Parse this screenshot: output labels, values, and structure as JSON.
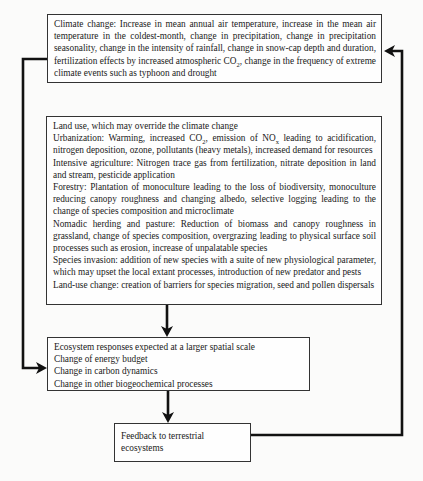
{
  "diagram": {
    "boxes": {
      "climate_change": {
        "text_parts": {
          "a": "Climate change: Increase in mean annual air temperature, increase in the mean air temperature in the coldest-month, change in precipitation, change in precipitation seasonality, change in the intensity of rainfall, change in snow-cap depth and duration, fertilization effects by increased atmospheric CO",
          "sub": "2",
          "b": ", change in the frequency of extreme climate events such as typhoon and drought"
        }
      },
      "land_use": {
        "title": "Land use, which may override the climate change",
        "urbanization": {
          "a": "Urbanization: Warming, increased CO",
          "sub1": "2",
          "b": ", emission of NO",
          "sub2": "x",
          "c": " leading to acidification, nitrogen deposition, ozone, pollutants (heavy metals), increased demand for resources"
        },
        "items": [
          "Intensive agriculture:  Nitrogen trace gas from fertilization, nitrate deposition in land and stream, pesticide application",
          "Forestry: Plantation of monoculture leading to the loss of biodiversity, monoculture reducing canopy roughness and changing albedo, selective logging leading to the change of species composition and microclimate",
          "Nomadic herding and pasture: Reduction of biomass and canopy roughness in grassland, change of species composition, overgrazing leading to physical surface soil processes such as erosion, increase of unpalatable species",
          "Species invasion: addition of new species with a suite of new physiological parameter, which may upset the local extant processes, introduction of new predator and pests",
          "Land-use change: creation of barriers for species migration, seed and pollen dispersals"
        ]
      },
      "ecosystem_responses": {
        "lines": [
          "Ecosystem responses expected at a larger spatial scale",
          "Change of energy budget",
          "Change in carbon dynamics",
          "Change in other biogeochemical processes"
        ]
      },
      "feedback": {
        "text": "Feedback to terrestrial ecosystems"
      }
    },
    "colors": {
      "line": "#111111",
      "border": "#333333",
      "background": "#fbfbfa"
    }
  }
}
